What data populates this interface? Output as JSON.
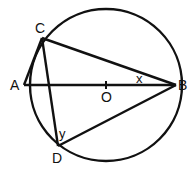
{
  "diagram": {
    "type": "circle-geometry",
    "circle": {
      "center": [
        106,
        85
      ],
      "radius": 76
    },
    "points": {
      "A": {
        "label": "A",
        "pos": [
          24,
          85
        ]
      },
      "B": {
        "label": "B",
        "pos": [
          176,
          85
        ]
      },
      "C": {
        "label": "C",
        "pos": [
          42,
          38
        ]
      },
      "D": {
        "label": "D",
        "pos": [
          58,
          146
        ]
      },
      "O": {
        "label": "O",
        "pos": [
          106,
          85
        ]
      }
    },
    "segments": [
      [
        "A",
        "B"
      ],
      [
        "A",
        "C"
      ],
      [
        "C",
        "B"
      ],
      [
        "C",
        "D"
      ],
      [
        "D",
        "B"
      ]
    ],
    "angles": {
      "x": {
        "label": "x",
        "at": "B"
      },
      "y": {
        "label": "y",
        "at": "D"
      }
    },
    "stroke_color": "#111111"
  }
}
